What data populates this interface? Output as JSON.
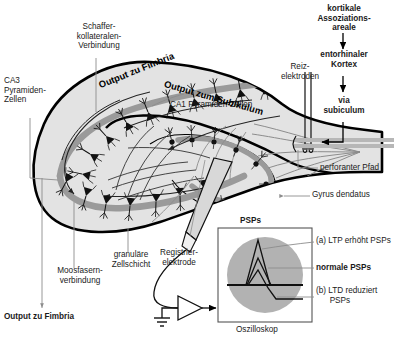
{
  "figure": {
    "language": "de"
  },
  "labels": {
    "schaffer": "Schaffer-\nkollateralen-\nVerbindung",
    "ca3": "CA3\nPyramiden-\nZellen",
    "ca1": "CA1 Pyramiden-Zellen",
    "output_fimbria_curve": "Output zu Fimbria",
    "output_subikulum_curve": "Output zum Subikulum",
    "output_fimbria_bottom": "Output zu Fimbria",
    "reizelektroden": "Reiz-\nelektroden",
    "perforanter_pfad": "perforanter Pfad",
    "gyrus_dendatus": "Gyrus dendatus",
    "granulaere": "granuläre\nZellschicht",
    "moosfasern": "Moosfasern-\nverbindung",
    "registrierelektrode": "Registrier-\nelektrode",
    "oszilloskop": "Oszilloskop",
    "psps": "PSPs"
  },
  "flow": {
    "step1": "kortikale\nAssoziations-\nareale",
    "step2": "entorhinaler\nKortex",
    "step3": "via\nsubiculum"
  },
  "traces": {
    "ltp": "(a) LTP erhöht PSPs",
    "normal": "normale PSPs",
    "ltd": "(b) LTD reduziert\n      PSPs"
  },
  "colors": {
    "outline": "#000000",
    "tissue_fill": "#e3e3e3",
    "band_gray": "#9a9a9a",
    "scope_circle": "#b2b2b2",
    "leader": "#8c8c8c",
    "text": "#1a1a1a"
  }
}
